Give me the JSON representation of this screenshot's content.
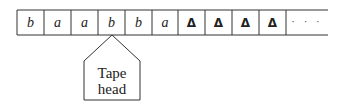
{
  "tape": {
    "cells": [
      {
        "symbol": "b",
        "style": "italic"
      },
      {
        "symbol": "a",
        "style": "italic"
      },
      {
        "symbol": "a",
        "style": "italic"
      },
      {
        "symbol": "b",
        "style": "italic"
      },
      {
        "symbol": "b",
        "style": "italic"
      },
      {
        "symbol": "a",
        "style": "italic"
      },
      {
        "symbol": "Δ",
        "style": "bold"
      },
      {
        "symbol": "Δ",
        "style": "bold"
      },
      {
        "symbol": "Δ",
        "style": "bold"
      },
      {
        "symbol": "Δ",
        "style": "bold"
      }
    ],
    "continuation": "· · ·"
  },
  "head": {
    "line1": "Tape",
    "line2": "head",
    "position_index": 3
  },
  "colors": {
    "stroke": "#333333",
    "background": "#ffffff"
  }
}
